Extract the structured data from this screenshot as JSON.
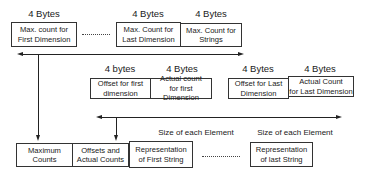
{
  "top_row": {
    "size_labels": [
      "4 Bytes",
      "4 Bytes",
      "4 Bytes"
    ],
    "boxes": [
      {
        "line1": "Max. count for",
        "line2": "First Dimension"
      },
      {
        "line1": "Max. Count for",
        "line2": "Last Dimension"
      },
      {
        "line1": "Max. Count for",
        "line2": "Strings"
      }
    ],
    "ellipsis": "........"
  },
  "middle_row": {
    "size_labels": [
      "4 bytes",
      "4 Bytes",
      "4 Bytes",
      "4 Bytes"
    ],
    "boxes": [
      {
        "line1": "Offset for first",
        "line2": "dimension"
      },
      {
        "line1": "Actual count",
        "line2": "for first Dimension"
      },
      {
        "line1": "Offset for Last",
        "line2": "Dimension"
      },
      {
        "line1": "Actual Count",
        "line2": "for Last Dimension"
      }
    ]
  },
  "element_size_labels": [
    "Size of each Element",
    "Size of each Element"
  ],
  "bottom_row": {
    "boxes": [
      {
        "line1": "Maximum",
        "line2": "Counts"
      },
      {
        "line1": "Offsets and",
        "line2": "Actual Counts"
      },
      {
        "line1": "Representation",
        "line2": "of First String"
      },
      {
        "line1": "Representation",
        "line2": "of last String"
      }
    ],
    "ellipsis": "..........."
  }
}
